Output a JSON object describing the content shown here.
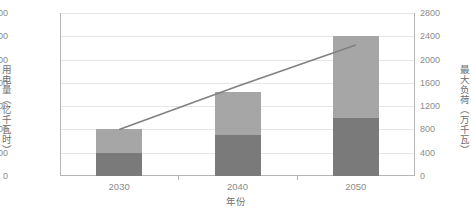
{
  "chart_data": {
    "type": "bar",
    "title": "",
    "subtitle": "",
    "xlabel": "年份",
    "ylabel": "用电量（亿千瓦时）",
    "y2label": "最大负荷（万千瓦）",
    "categories": [
      "2030",
      "2040",
      "2050"
    ],
    "ylim": [
      0,
      1400
    ],
    "y2lim": [
      0,
      2800
    ],
    "yticks": [
      "1400",
      "1200",
      "1000",
      "800",
      "600",
      "400",
      "200",
      "0"
    ],
    "ytick_values": [
      1400,
      1200,
      1000,
      800,
      600,
      400,
      200,
      0
    ],
    "y2ticks": [
      "2800",
      "2400",
      "2000",
      "1600",
      "1200",
      "800",
      "400",
      "0"
    ],
    "y2tick_values": [
      2800,
      2400,
      2000,
      1600,
      1200,
      800,
      400,
      0
    ],
    "grid": true,
    "legend_position": "none",
    "series": [
      {
        "name": "用电量-下段",
        "kind": "bar",
        "stack": "electricity",
        "axis": "left",
        "color": "#7a7a7a",
        "values": [
          200,
          350,
          500
        ]
      },
      {
        "name": "用电量-上段",
        "kind": "bar",
        "stack": "electricity",
        "axis": "left",
        "color": "#a6a6a6",
        "values": [
          200,
          370,
          700
        ]
      },
      {
        "name": "最大负荷",
        "kind": "line",
        "axis": "right",
        "color": "#808080",
        "values": [
          800,
          1540,
          2250
        ]
      }
    ],
    "bar_totals": [
      400,
      720,
      1200
    ]
  },
  "colors": {
    "bar_upper": "#a6a6a6",
    "bar_lower": "#7a7a7a",
    "line": "#808080",
    "grid": "#e6e6e6",
    "axis": "#b5b5b5",
    "tick_text": "#8c8c8c",
    "title_text": "#6e6e6e",
    "background": "#ffffff"
  }
}
